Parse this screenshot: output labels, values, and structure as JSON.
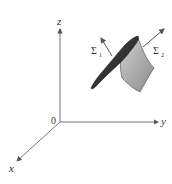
{
  "figure": {
    "type": "3D coordinate diagram with surface pieces",
    "axes": {
      "x_label": "x",
      "y_label": "y",
      "z_label": "z",
      "origin_label": "0"
    },
    "surfaces": [
      {
        "label": "Σ",
        "subscript": "1",
        "shade": "dark",
        "color": "#2b2b2b"
      },
      {
        "label": "Σ",
        "subscript": "2",
        "shade": "light",
        "color": "#a8a8a8"
      }
    ],
    "colors": {
      "axis": "#555555",
      "normal_arrow": "#555555"
    }
  }
}
